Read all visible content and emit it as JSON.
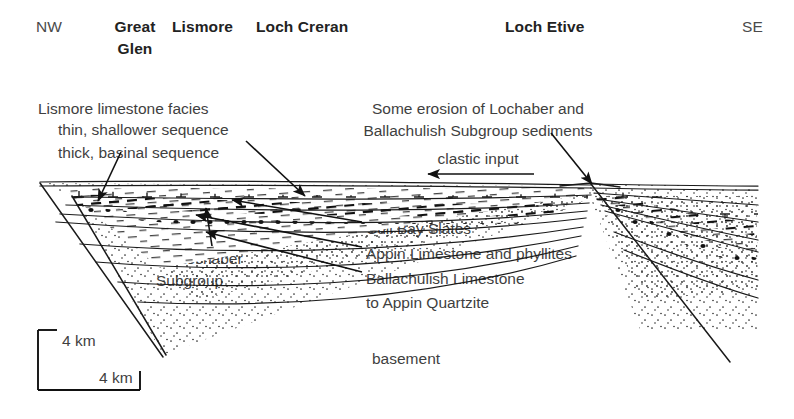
{
  "figure": {
    "type": "geological-cross-section",
    "orientation_left": "NW",
    "orientation_right": "SE"
  },
  "header": {
    "nw": "NW",
    "se": "SE",
    "localities": [
      {
        "line1": "Great",
        "line2": "Glen"
      },
      {
        "line1": "Lismore",
        "line2": ""
      },
      {
        "line1": "Loch Creran",
        "line2": ""
      },
      {
        "line1": "Loch Etive",
        "line2": ""
      }
    ]
  },
  "annotations": {
    "left": {
      "line1": "Lismore limestone facies",
      "line2": "thin, shallower sequence",
      "line3": "thick, basinal sequence"
    },
    "right": {
      "line1": "Some erosion of Lochaber and",
      "line2": "Ballachulish Subgroup sediments",
      "line3": "clastic input"
    }
  },
  "unit_labels": {
    "cuil_bay": "Cuil Bay Slates",
    "appin_limestone": "Appin Limestone and phyllites",
    "ballachulish": "Ballachulish Limestone",
    "appin_quartzite": "to Appin Quartzite",
    "lochaber_line1": "Lochaber",
    "lochaber_line2": "Subgroup",
    "basement": "basement"
  },
  "scale_bar": {
    "vertical_label": "4 km",
    "horizontal_label": "4 km"
  },
  "colors": {
    "ink": "#1a1a1a",
    "text": "#3f3f3f",
    "heading": "#222222",
    "background": "#ffffff"
  }
}
